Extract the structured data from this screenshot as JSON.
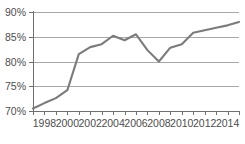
{
  "chart_data": {
    "type": "line",
    "title": "",
    "subtitle": "",
    "xlabel": "",
    "ylabel": "",
    "x": [
      1997,
      1998,
      1999,
      2000,
      2001,
      2002,
      2003,
      2004,
      2005,
      2006,
      2007,
      2008,
      2009,
      2010,
      2011,
      2012,
      2013,
      2014,
      2015
    ],
    "values": [
      70.5,
      71.6,
      72.6,
      74.2,
      81.5,
      82.9,
      83.5,
      85.2,
      84.3,
      85.5,
      82.3,
      80.0,
      82.8,
      83.5,
      85.8,
      86.3,
      86.8,
      87.3,
      88.0
    ],
    "series": [
      {
        "name": "series-1",
        "color": "#7b7b7b",
        "values": [
          70.5,
          71.6,
          72.6,
          74.2,
          81.5,
          82.9,
          83.5,
          85.2,
          84.3,
          85.5,
          82.3,
          80.0,
          82.8,
          83.5,
          85.8,
          86.3,
          86.8,
          87.3,
          88.0
        ]
      }
    ],
    "ylim": [
      70,
      90
    ],
    "xlim": [
      1997,
      2015
    ],
    "yticks": [
      70,
      75,
      80,
      85,
      90
    ],
    "ytick_labels": [
      "70%",
      "75%",
      "85%",
      "85%",
      "90%"
    ],
    "ytick_labels_display": [
      "70%",
      "75%",
      "80%",
      "85%",
      "90%"
    ],
    "xticks": [
      1997,
      1998,
      1999,
      2000,
      2001,
      2002,
      2003,
      2004,
      2005,
      2006,
      2007,
      2008,
      2009,
      2010,
      2011,
      2012,
      2013,
      2014,
      2015
    ],
    "xtick_labels": [
      "1998",
      "2000",
      "2002",
      "2004",
      "2006",
      "2008",
      "2010",
      "2012",
      "2014"
    ],
    "xtick_label_years": [
      1998,
      2000,
      2002,
      2004,
      2006,
      2008,
      2010,
      2012,
      2014
    ],
    "grid": true,
    "grid_axis": "y",
    "legend": false,
    "legend_position": "none",
    "colors": {
      "line": "#7b7b7b",
      "grid": "#a8a8a8",
      "axis": "#6f6f6f",
      "text": "#4d4d4d",
      "background": "#ffffff"
    }
  },
  "plot": {
    "left_px": 33,
    "right_px": 239,
    "top_px": 12,
    "bottom_px": 111
  }
}
